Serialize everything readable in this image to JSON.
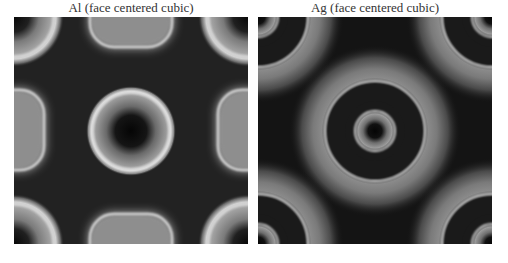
{
  "figure": {
    "panels": [
      {
        "title": "Al (face centered cubic)",
        "element": "Al",
        "lattice": "face centered cubic"
      },
      {
        "title": "Ag (face centered cubic)",
        "element": "Ag",
        "lattice": "face centered cubic"
      }
    ]
  }
}
